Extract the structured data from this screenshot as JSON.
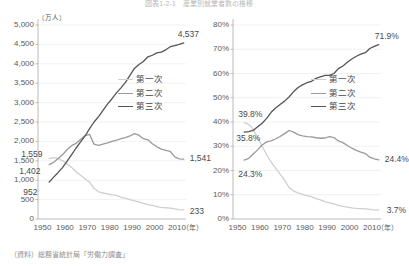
{
  "title": "図表1-2-1　産業別就業者数の推移",
  "source_note": "（資料）総務省統計局「労働力調査」",
  "colors": {
    "primary_sector": "#cfcfcf",
    "secondary_sector": "#9a9a9a",
    "tertiary_sector": "#555555",
    "axis": "#aaaaaa",
    "grid": "#e8e8e8",
    "text": "#5a5a5a"
  },
  "legend": {
    "position": "center-right",
    "items": [
      {
        "label": "第一次",
        "color": "#cfcfcf"
      },
      {
        "label": "第二次",
        "color": "#9a9a9a"
      },
      {
        "label": "第三次",
        "color": "#555555"
      }
    ]
  },
  "chart_data": [
    {
      "id": "employment_count",
      "type": "line",
      "title": "",
      "xlabel": "（年）",
      "ylabel": "（万人）",
      "unit_label": "（万人）",
      "xlim": [
        1948,
        2014
      ],
      "ylim": [
        0,
        5000
      ],
      "ytick_step": 500,
      "grid": true,
      "legend_position": "center-right",
      "ytick_labels": [
        "5,000",
        "4,500",
        "4,000",
        "3,500",
        "3,000",
        "2,500",
        "2,000",
        "1,500",
        "1,000",
        "500",
        "0"
      ],
      "ytick_values": [
        5000,
        4500,
        4000,
        3500,
        3000,
        2500,
        2000,
        1500,
        1000,
        500,
        0
      ],
      "xtick_labels": [
        "1950",
        "1960",
        "1970",
        "1980",
        "1990",
        "2000",
        "2010"
      ],
      "xtick_values": [
        1950,
        1960,
        1970,
        1980,
        1990,
        2000,
        2010
      ],
      "xaxis_suffix": "（年）",
      "annotations": [
        {
          "text": "1,559",
          "series": "第一次",
          "x": 1953,
          "y": 1559
        },
        {
          "text": "1,402",
          "series": "第二次",
          "x": 1953,
          "y": 1402
        },
        {
          "text": "952",
          "series": "第三次",
          "x": 1953,
          "y": 952
        },
        {
          "text": "4,537",
          "series": "第三次",
          "x": 2013,
          "y": 4537
        },
        {
          "text": "1,541",
          "series": "第二次",
          "x": 2013,
          "y": 1541
        },
        {
          "text": "233",
          "series": "第一次",
          "x": 2013,
          "y": 233
        }
      ],
      "series": [
        {
          "name": "第一次",
          "color": "#cfcfcf",
          "x": [
            1953,
            1955,
            1957,
            1959,
            1961,
            1963,
            1965,
            1967,
            1969,
            1971,
            1973,
            1975,
            1977,
            1979,
            1981,
            1983,
            1985,
            1987,
            1989,
            1991,
            1993,
            1995,
            1997,
            1999,
            2001,
            2003,
            2005,
            2007,
            2009,
            2011,
            2013
          ],
          "values": [
            1559,
            1580,
            1560,
            1500,
            1420,
            1330,
            1220,
            1130,
            1040,
            950,
            790,
            700,
            670,
            650,
            620,
            610,
            560,
            540,
            500,
            470,
            440,
            400,
            370,
            350,
            320,
            300,
            290,
            280,
            260,
            240,
            233
          ]
        },
        {
          "name": "第二次",
          "color": "#9a9a9a",
          "x": [
            1953,
            1955,
            1957,
            1959,
            1961,
            1963,
            1965,
            1967,
            1969,
            1971,
            1973,
            1975,
            1977,
            1979,
            1981,
            1983,
            1985,
            1987,
            1989,
            1991,
            1993,
            1995,
            1997,
            1999,
            2001,
            2003,
            2005,
            2007,
            2009,
            2011,
            2013
          ],
          "values": [
            1402,
            1460,
            1560,
            1660,
            1790,
            1890,
            1950,
            2050,
            2150,
            2180,
            1930,
            1900,
            1930,
            1960,
            2000,
            2030,
            2070,
            2100,
            2140,
            2200,
            2160,
            2070,
            2040,
            1940,
            1860,
            1800,
            1770,
            1740,
            1600,
            1550,
            1541
          ]
        },
        {
          "name": "第三次",
          "color": "#555555",
          "x": [
            1953,
            1955,
            1957,
            1959,
            1961,
            1963,
            1965,
            1967,
            1969,
            1971,
            1973,
            1975,
            1977,
            1979,
            1981,
            1983,
            1985,
            1987,
            1989,
            1991,
            1993,
            1995,
            1997,
            1999,
            2001,
            2003,
            2005,
            2007,
            2009,
            2011,
            2013
          ],
          "values": [
            952,
            1080,
            1200,
            1330,
            1490,
            1660,
            1830,
            1990,
            2140,
            2330,
            2500,
            2640,
            2800,
            2960,
            3100,
            3250,
            3380,
            3520,
            3700,
            3880,
            3980,
            4060,
            4180,
            4220,
            4280,
            4300,
            4360,
            4440,
            4470,
            4500,
            4537
          ]
        }
      ]
    },
    {
      "id": "employment_share",
      "type": "line",
      "title": "",
      "xlabel": "（年）",
      "ylabel": "",
      "xlim": [
        1948,
        2014
      ],
      "ylim": [
        0,
        80
      ],
      "ytick_step": 10,
      "grid": true,
      "legend_position": "center-right",
      "ytick_labels": [
        "80%",
        "70%",
        "60%",
        "50%",
        "40%",
        "30%",
        "20%",
        "10%",
        "0%"
      ],
      "ytick_values": [
        80,
        70,
        60,
        50,
        40,
        30,
        20,
        10,
        0
      ],
      "xtick_labels": [
        "1950",
        "1960",
        "1970",
        "1980",
        "1990",
        "2000",
        "2010"
      ],
      "xtick_values": [
        1950,
        1960,
        1970,
        1980,
        1990,
        2000,
        2010
      ],
      "xaxis_suffix": "（年）",
      "annotations": [
        {
          "text": "39.8%",
          "series": "第一次",
          "x": 1953,
          "y": 39.8
        },
        {
          "text": "35.8%",
          "series": "第三次",
          "x": 1953,
          "y": 35.8
        },
        {
          "text": "24.3%",
          "series": "第二次",
          "x": 1953,
          "y": 24.3
        },
        {
          "text": "71.9%",
          "series": "第三次",
          "x": 2013,
          "y": 71.9
        },
        {
          "text": "24.4%",
          "series": "第二次",
          "x": 2013,
          "y": 24.4
        },
        {
          "text": "3.7%",
          "series": "第一次",
          "x": 2013,
          "y": 3.7
        }
      ],
      "series": [
        {
          "name": "第一次",
          "color": "#cfcfcf",
          "x": [
            1953,
            1955,
            1957,
            1959,
            1961,
            1963,
            1965,
            1967,
            1969,
            1971,
            1973,
            1975,
            1977,
            1979,
            1981,
            1983,
            1985,
            1987,
            1989,
            1991,
            1993,
            1995,
            1997,
            1999,
            2001,
            2003,
            2005,
            2007,
            2009,
            2011,
            2013
          ],
          "values": [
            39.8,
            39.0,
            37.0,
            33.5,
            30.0,
            26.5,
            23.5,
            21.0,
            18.5,
            16.0,
            13.0,
            11.5,
            10.8,
            10.2,
            9.6,
            9.2,
            8.4,
            7.9,
            7.2,
            6.6,
            6.2,
            5.6,
            5.2,
            4.9,
            4.6,
            4.4,
            4.3,
            4.2,
            4.0,
            3.8,
            3.7
          ]
        },
        {
          "name": "第二次",
          "color": "#9a9a9a",
          "x": [
            1953,
            1955,
            1957,
            1959,
            1961,
            1963,
            1965,
            1967,
            1969,
            1971,
            1973,
            1975,
            1977,
            1979,
            1981,
            1983,
            1985,
            1987,
            1989,
            1991,
            1993,
            1995,
            1997,
            1999,
            2001,
            2003,
            2005,
            2007,
            2009,
            2011,
            2013
          ],
          "values": [
            24.3,
            25.0,
            26.8,
            28.5,
            30.5,
            31.8,
            32.2,
            33.0,
            34.0,
            35.2,
            36.5,
            35.8,
            34.8,
            34.3,
            34.0,
            33.9,
            33.5,
            33.3,
            33.4,
            34.0,
            33.6,
            32.2,
            31.5,
            30.3,
            29.2,
            28.3,
            27.6,
            27.0,
            25.5,
            24.8,
            24.4
          ]
        },
        {
          "name": "第三次",
          "color": "#555555",
          "x": [
            1953,
            1955,
            1957,
            1959,
            1961,
            1963,
            1965,
            1967,
            1969,
            1971,
            1973,
            1975,
            1977,
            1979,
            1981,
            1983,
            1985,
            1987,
            1989,
            1991,
            1993,
            1995,
            1997,
            1999,
            2001,
            2003,
            2005,
            2007,
            2009,
            2011,
            2013
          ],
          "values": [
            35.8,
            36.0,
            36.5,
            38.0,
            39.5,
            41.5,
            44.0,
            45.8,
            47.2,
            48.6,
            50.3,
            52.5,
            54.2,
            55.3,
            56.2,
            56.8,
            58.0,
            58.6,
            59.2,
            59.2,
            60.0,
            62.0,
            63.1,
            64.6,
            66.0,
            67.1,
            68.0,
            68.6,
            70.3,
            71.2,
            71.9
          ]
        }
      ]
    }
  ]
}
